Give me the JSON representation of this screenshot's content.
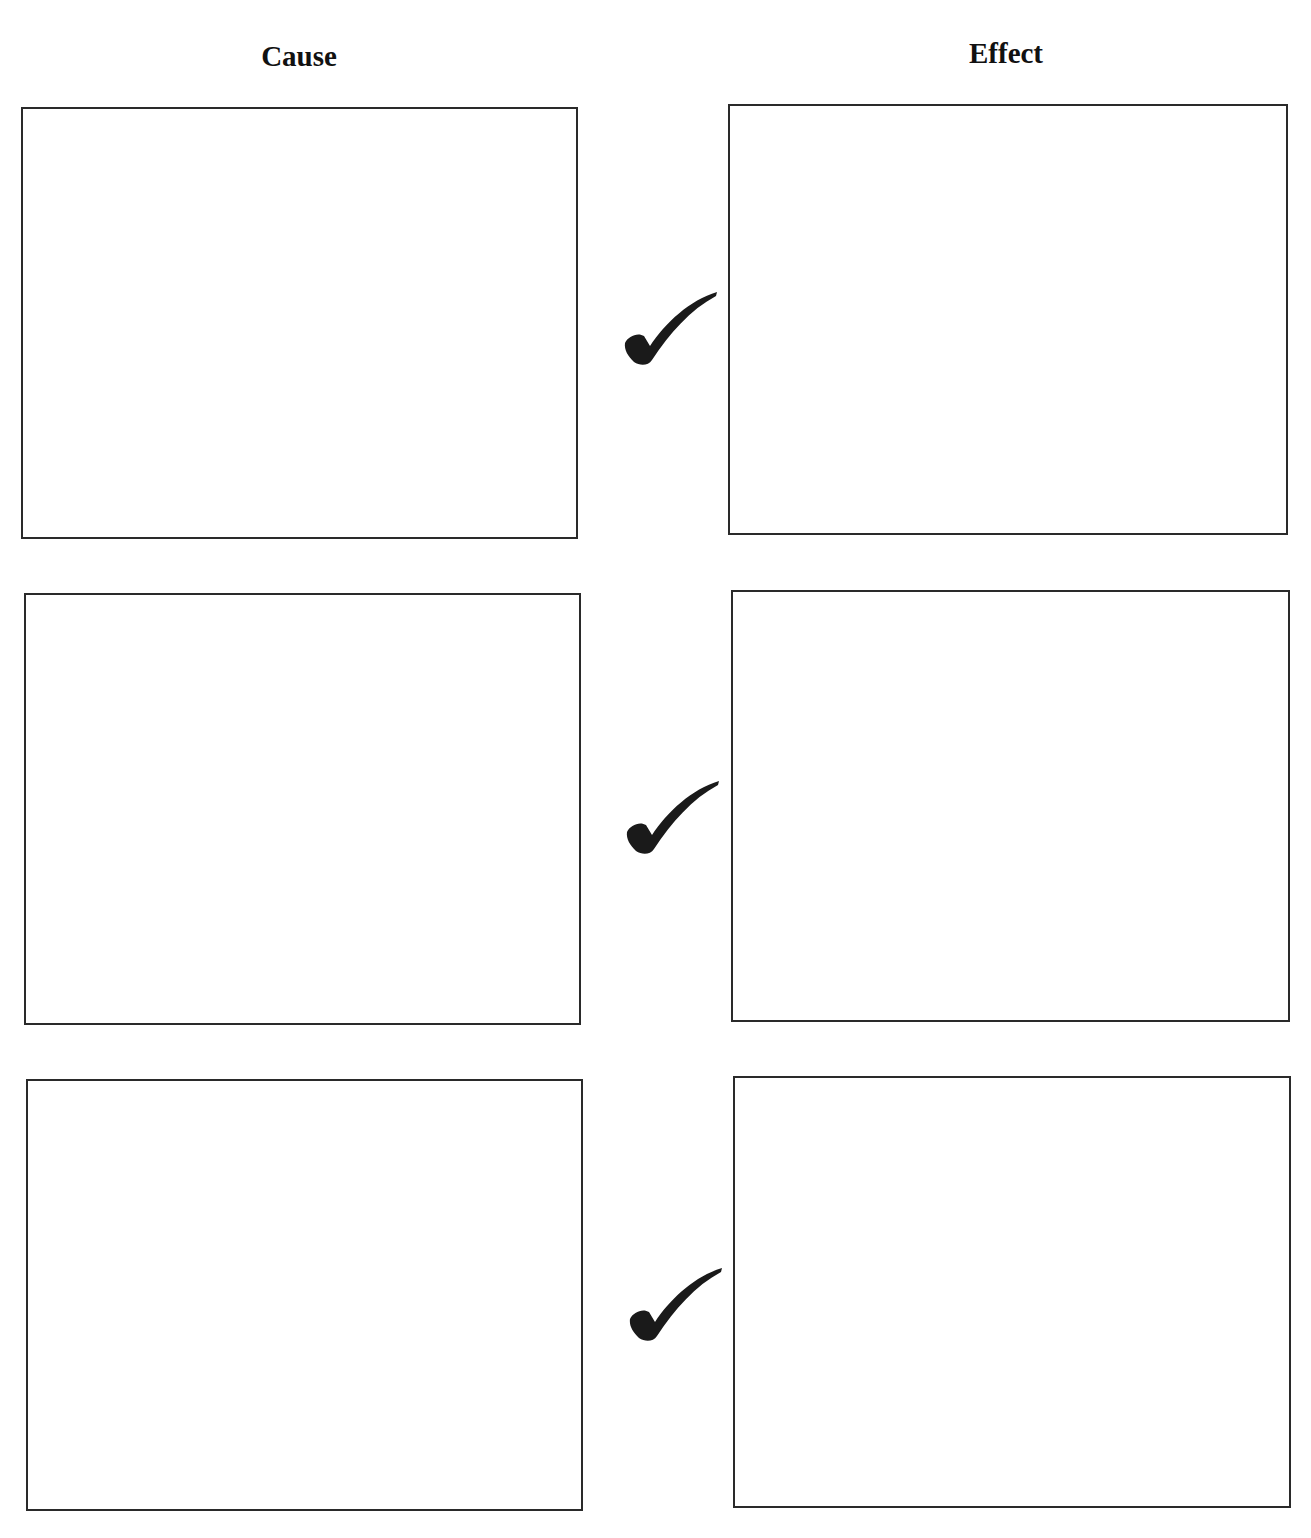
{
  "headings": {
    "cause": "Cause",
    "effect": "Effect"
  },
  "rows": [
    {
      "cause_text": "",
      "effect_text": ""
    },
    {
      "cause_text": "",
      "effect_text": ""
    },
    {
      "cause_text": "",
      "effect_text": ""
    }
  ],
  "icons": {
    "connector": "checkmark-icon"
  },
  "colors": {
    "border": "#2a2a2a",
    "check": "#1a1a1a"
  }
}
